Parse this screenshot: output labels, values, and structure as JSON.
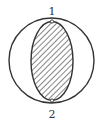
{
  "diagram": {
    "type": "circle-with-hatched-ellipse",
    "colors": {
      "stroke": "#333333",
      "hatch": "#444444",
      "background": "#ffffff"
    },
    "outer_circle": {
      "cx": 51.5,
      "cy": 60.5,
      "r": 42.5
    },
    "inner_ellipse": {
      "cx": 52,
      "cy": 61,
      "rx": 21,
      "ry": 39.5,
      "fill": "diagonal-hatch"
    },
    "points": [
      {
        "id": "point-1",
        "label": "1",
        "x": 52,
        "y": 21.5,
        "label_x": 52,
        "label_y": 15
      },
      {
        "id": "point-2",
        "label": "2",
        "x": 52,
        "y": 100.5,
        "label_x": 52,
        "label_y": 117
      }
    ]
  }
}
